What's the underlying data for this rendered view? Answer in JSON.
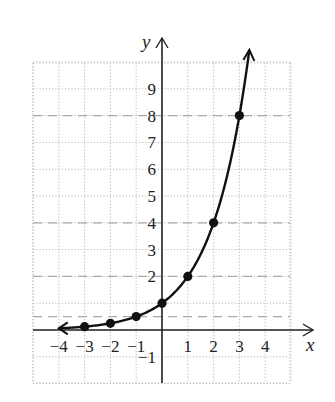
{
  "chart_data": {
    "type": "line",
    "title": "",
    "xlabel": "x",
    "ylabel": "y",
    "function": "y = 2^x",
    "x_ticks": [
      "-4",
      "-3",
      "-2",
      "-1",
      "1",
      "2",
      "3",
      "4"
    ],
    "y_ticks": [
      "-1",
      "2",
      "3",
      "4",
      "5",
      "6",
      "7",
      "8",
      "9"
    ],
    "xlim": [
      -5,
      5.5
    ],
    "ylim": [
      -2,
      10.5
    ],
    "grid": "dotted",
    "dashed_reference_lines_y": [
      0.5,
      2,
      4,
      8
    ],
    "points": [
      {
        "x": -3,
        "y": 0.125
      },
      {
        "x": -2,
        "y": 0.25
      },
      {
        "x": -1,
        "y": 0.5
      },
      {
        "x": 0,
        "y": 1
      },
      {
        "x": 1,
        "y": 2
      },
      {
        "x": 2,
        "y": 4
      },
      {
        "x": 3,
        "y": 8
      }
    ],
    "curve_arrows": [
      "left end toward x=-4",
      "top end near x=3.3, y=10.5"
    ]
  },
  "colors": {
    "grid": "#b8b8b8",
    "dashed": "#aaaaaa",
    "curve": "#111111",
    "axis": "#222222"
  }
}
